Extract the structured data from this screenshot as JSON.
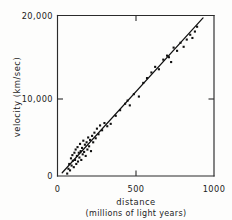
{
  "chart_data": {
    "type": "scatter",
    "title": "",
    "xlabel": "distance",
    "xlabel_sub": "(millions of light years)",
    "ylabel": "velocity  (km/sec)",
    "xlim": [
      0,
      1000
    ],
    "ylim": [
      0,
      20000
    ],
    "grid": false,
    "legend": null,
    "x_ticks": [
      {
        "value": 0,
        "label": "0"
      },
      {
        "value": 500,
        "label": "500"
      },
      {
        "value": 1000,
        "label": "1000"
      }
    ],
    "y_ticks": [
      {
        "value": 0,
        "label": "0"
      },
      {
        "value": 10000,
        "label": "10,000"
      },
      {
        "value": 20000,
        "label": "20,000"
      }
    ],
    "marker": "filled-square",
    "marker_color": "#101010",
    "line_color": "#111111",
    "fit_line": {
      "label": "Hubble law fit",
      "x0": 30,
      "y0": 400,
      "x1": 930,
      "y1": 19700
    },
    "points": [
      {
        "x": 62,
        "y": 300
      },
      {
        "x": 70,
        "y": 900
      },
      {
        "x": 75,
        "y": 1500
      },
      {
        "x": 80,
        "y": 700
      },
      {
        "x": 86,
        "y": 2200
      },
      {
        "x": 90,
        "y": 1300
      },
      {
        "x": 95,
        "y": 2600
      },
      {
        "x": 98,
        "y": 1900
      },
      {
        "x": 104,
        "y": 1100
      },
      {
        "x": 108,
        "y": 2900
      },
      {
        "x": 112,
        "y": 2000
      },
      {
        "x": 116,
        "y": 3300
      },
      {
        "x": 120,
        "y": 1500
      },
      {
        "x": 124,
        "y": 2500
      },
      {
        "x": 128,
        "y": 3600
      },
      {
        "x": 131,
        "y": 1800
      },
      {
        "x": 136,
        "y": 2900
      },
      {
        "x": 140,
        "y": 2300
      },
      {
        "x": 144,
        "y": 4000
      },
      {
        "x": 148,
        "y": 3100
      },
      {
        "x": 152,
        "y": 2000
      },
      {
        "x": 157,
        "y": 3500
      },
      {
        "x": 161,
        "y": 2700
      },
      {
        "x": 165,
        "y": 4400
      },
      {
        "x": 170,
        "y": 3000
      },
      {
        "x": 175,
        "y": 3900
      },
      {
        "x": 180,
        "y": 2500
      },
      {
        "x": 186,
        "y": 4200
      },
      {
        "x": 191,
        "y": 3300
      },
      {
        "x": 196,
        "y": 4800
      },
      {
        "x": 202,
        "y": 3700
      },
      {
        "x": 208,
        "y": 4500
      },
      {
        "x": 214,
        "y": 3100
      },
      {
        "x": 221,
        "y": 5000
      },
      {
        "x": 228,
        "y": 4200
      },
      {
        "x": 236,
        "y": 5400
      },
      {
        "x": 244,
        "y": 4700
      },
      {
        "x": 252,
        "y": 5900
      },
      {
        "x": 262,
        "y": 5200
      },
      {
        "x": 272,
        "y": 6300
      },
      {
        "x": 285,
        "y": 5700
      },
      {
        "x": 300,
        "y": 6600
      },
      {
        "x": 318,
        "y": 6200
      },
      {
        "x": 340,
        "y": 6500
      },
      {
        "x": 372,
        "y": 7500
      },
      {
        "x": 400,
        "y": 8200
      },
      {
        "x": 432,
        "y": 9000
      },
      {
        "x": 448,
        "y": 9400
      },
      {
        "x": 462,
        "y": 8800
      },
      {
        "x": 488,
        "y": 10200
      },
      {
        "x": 520,
        "y": 9900
      },
      {
        "x": 548,
        "y": 11600
      },
      {
        "x": 572,
        "y": 12200
      },
      {
        "x": 600,
        "y": 12900
      },
      {
        "x": 624,
        "y": 13600
      },
      {
        "x": 648,
        "y": 13300
      },
      {
        "x": 676,
        "y": 14500
      },
      {
        "x": 700,
        "y": 15000
      },
      {
        "x": 712,
        "y": 14800
      },
      {
        "x": 726,
        "y": 14200
      },
      {
        "x": 742,
        "y": 16000
      },
      {
        "x": 764,
        "y": 15600
      },
      {
        "x": 786,
        "y": 16600
      },
      {
        "x": 806,
        "y": 16100
      },
      {
        "x": 826,
        "y": 17000
      },
      {
        "x": 848,
        "y": 17600
      },
      {
        "x": 862,
        "y": 17200
      },
      {
        "x": 878,
        "y": 18000
      },
      {
        "x": 892,
        "y": 18600
      }
    ]
  }
}
